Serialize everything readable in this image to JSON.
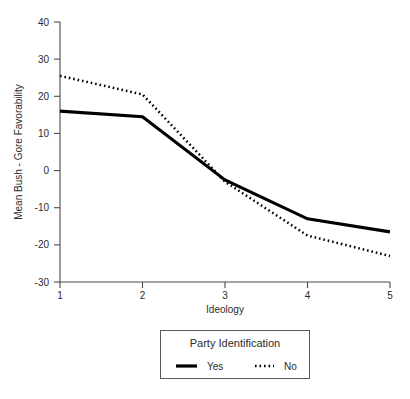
{
  "chart_data": {
    "type": "line",
    "title": "",
    "xlabel": "Ideology",
    "ylabel": "Mean Bush - Gore Favorability",
    "x": [
      1,
      2,
      3,
      4,
      5
    ],
    "xticklabels": [
      "1",
      "2",
      "3",
      "4",
      "5"
    ],
    "yticklabels": [
      "40",
      "30",
      "20",
      "10",
      "0",
      "-10",
      "-20",
      "-30"
    ],
    "yticks": [
      40,
      30,
      20,
      10,
      0,
      -10,
      -20,
      -30
    ],
    "xlim": [
      1,
      5
    ],
    "ylim": [
      -30,
      40
    ],
    "grid": false,
    "legend_position": "below-axes",
    "legend_title": "Party Identification",
    "series": [
      {
        "name": "Yes",
        "style": "solid",
        "color": "#000000",
        "values": [
          16.0,
          14.5,
          -2.5,
          -13.0,
          -16.5
        ]
      },
      {
        "name": "No",
        "style": "dotted",
        "color": "#000000",
        "values": [
          25.5,
          20.5,
          -3.0,
          -17.5,
          -23.0
        ]
      }
    ]
  },
  "axes": {
    "x_axis_name": "ideology-axis",
    "y_axis_name": "favorability-axis"
  }
}
